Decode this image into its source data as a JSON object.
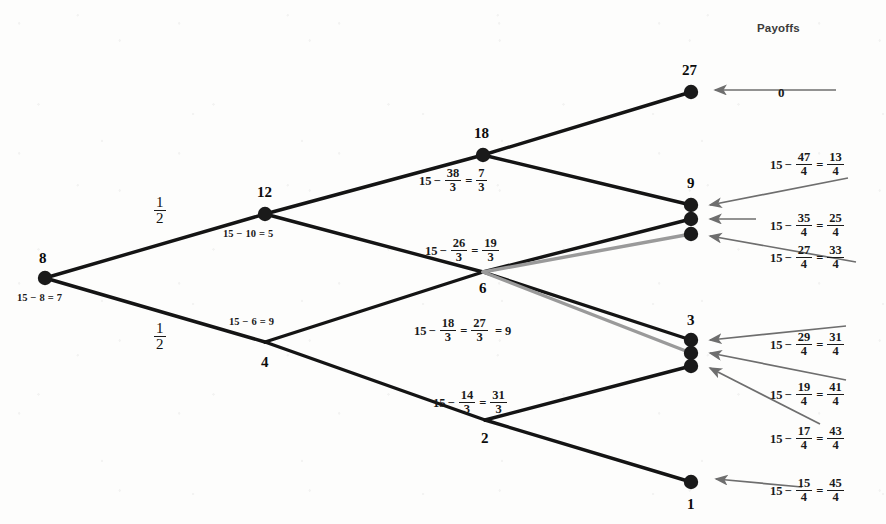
{
  "diagram": {
    "title": "Payoffs",
    "type": "game-tree",
    "nodes": [
      {
        "id": "n8",
        "label": "8",
        "x": 45,
        "y": 278,
        "dot": true,
        "label_dx": -6,
        "label_dy": -28
      },
      {
        "id": "n12",
        "label": "12",
        "x": 265,
        "y": 214,
        "dot": true,
        "label_dx": -8,
        "label_dy": -30
      },
      {
        "id": "n4",
        "label": "4",
        "x": 265,
        "y": 342,
        "dot": false,
        "label_dx": -4,
        "label_dy": 12
      },
      {
        "id": "n18",
        "label": "18",
        "x": 483,
        "y": 155,
        "dot": true,
        "label_dx": -9,
        "label_dy": -30
      },
      {
        "id": "n6",
        "label": "6",
        "x": 483,
        "y": 272,
        "dot": false,
        "label_dx": -4,
        "label_dy": 8
      },
      {
        "id": "n2",
        "label": "2",
        "x": 485,
        "y": 420,
        "dot": false,
        "label_dx": -4,
        "label_dy": 10
      },
      {
        "id": "n27",
        "label": "27",
        "x": 691,
        "y": 92,
        "dot": true,
        "label_dx": -9,
        "label_dy": -30
      },
      {
        "id": "n9",
        "label": "9",
        "x": 691,
        "y": 205,
        "dot": true,
        "label_dx": -4,
        "label_dy": -30
      },
      {
        "id": "n9b",
        "label": "",
        "x": 691,
        "y": 219,
        "dot": true,
        "label_dx": 0,
        "label_dy": 0
      },
      {
        "id": "n9c",
        "label": "",
        "x": 691,
        "y": 234,
        "dot": true,
        "label_dx": 0,
        "label_dy": 0
      },
      {
        "id": "n3",
        "label": "3",
        "x": 691,
        "y": 340,
        "dot": true,
        "label_dx": -4,
        "label_dy": -28
      },
      {
        "id": "n3b",
        "label": "",
        "x": 691,
        "y": 353,
        "dot": true,
        "label_dx": 0,
        "label_dy": 0
      },
      {
        "id": "n3c",
        "label": "",
        "x": 691,
        "y": 366,
        "dot": true,
        "label_dx": 0,
        "label_dy": 0
      },
      {
        "id": "n1",
        "label": "1",
        "x": 691,
        "y": 482,
        "dot": true,
        "label_dx": -4,
        "label_dy": 14
      }
    ],
    "edges": [
      {
        "from": "n8",
        "to": "n12",
        "color": "#141414",
        "width": 3.4
      },
      {
        "from": "n8",
        "to": "n4",
        "color": "#141414",
        "width": 3.4
      },
      {
        "from": "n12",
        "to": "n18",
        "color": "#141414",
        "width": 3.4
      },
      {
        "from": "n12",
        "to": "n6",
        "color": "#141414",
        "width": 3.4
      },
      {
        "from": "n4",
        "to": "n6",
        "color": "#141414",
        "width": 3.4
      },
      {
        "from": "n4",
        "to": "n2",
        "color": "#141414",
        "width": 3.4
      },
      {
        "from": "n18",
        "to": "n27",
        "color": "#141414",
        "width": 3.4
      },
      {
        "from": "n18",
        "to": "n9",
        "color": "#141414",
        "width": 3.4
      },
      {
        "from": "n6",
        "to": "n9b",
        "color": "#141414",
        "width": 3.4
      },
      {
        "from": "n6",
        "to": "n3",
        "color": "#141414",
        "width": 3.4
      },
      {
        "from": "n6",
        "to": "n9c",
        "color": "#9a9a9a",
        "width": 3.4
      },
      {
        "from": "n6",
        "to": "n3b",
        "color": "#9a9a9a",
        "width": 3.4
      },
      {
        "from": "n2",
        "to": "n3c",
        "color": "#141414",
        "width": 3.4
      },
      {
        "from": "n2",
        "to": "n1",
        "color": "#141414",
        "width": 3.4
      }
    ],
    "probability_labels": [
      {
        "id": "p-upper",
        "text": "1/2",
        "num": "1",
        "den": "2",
        "x": 152,
        "y": 196
      },
      {
        "id": "p-lower",
        "text": "1/2",
        "num": "1",
        "den": "2",
        "x": 152,
        "y": 322
      }
    ],
    "edge_equations": [
      {
        "id": "eq-n8",
        "x": 16,
        "y": 292,
        "parts": [
          {
            "t": "15"
          },
          {
            "t": "−"
          },
          {
            "t": "8"
          },
          {
            "t": "="
          },
          {
            "t": "7"
          }
        ]
      },
      {
        "id": "eq-n12",
        "x": 222,
        "y": 228,
        "parts": [
          {
            "t": "15"
          },
          {
            "t": "−"
          },
          {
            "t": "10"
          },
          {
            "t": "="
          },
          {
            "t": "5"
          }
        ]
      },
      {
        "id": "eq-n4",
        "x": 228,
        "y": 316,
        "parts": [
          {
            "t": "15"
          },
          {
            "t": "−"
          },
          {
            "t": "6"
          },
          {
            "t": "="
          },
          {
            "t": "9"
          }
        ]
      },
      {
        "id": "eq-n18",
        "x": 419,
        "y": 168,
        "frac": true
      },
      {
        "id": "eq-n6u",
        "x": 425,
        "y": 238,
        "frac": true
      },
      {
        "id": "eq-n6l",
        "x": 414,
        "y": 318,
        "frac": true
      },
      {
        "id": "eq-n2",
        "x": 433,
        "y": 390,
        "frac": true
      }
    ],
    "node_expressions": {
      "n18": {
        "a": "15",
        "minus": "−",
        "n1": "38",
        "d1": "3",
        "eq": "=",
        "n2": "7",
        "d2": "3",
        "tail": ""
      },
      "n6u": {
        "a": "15",
        "minus": "−",
        "n1": "26",
        "d1": "3",
        "eq": "=",
        "n2": "19",
        "d2": "3",
        "tail": ""
      },
      "n6l": {
        "a": "15",
        "minus": "−",
        "n1": "18",
        "d1": "3",
        "eq": "=",
        "n2": "27",
        "d2": "3",
        "tail": "= 9"
      },
      "n2": {
        "a": "15",
        "minus": "−",
        "n1": "14",
        "d1": "3",
        "eq": "=",
        "n2": "31",
        "d2": "3",
        "tail": ""
      }
    },
    "payoffs": [
      {
        "id": "payoff-27",
        "plain": "0",
        "x": 778,
        "y": 85,
        "target": "n27",
        "arrow": {
          "x1": 836,
          "y1": 90,
          "x2": 715,
          "y2": 90
        }
      },
      {
        "id": "payoff-9a",
        "a": "15",
        "minus": "−",
        "n1": "47",
        "d1": "4",
        "eq": "=",
        "n2": "13",
        "d2": "4",
        "x": 770,
        "y": 152,
        "target": "n9",
        "arrow": {
          "x1": 848,
          "y1": 178,
          "x2": 710,
          "y2": 205
        }
      },
      {
        "id": "payoff-9b",
        "a": "15",
        "minus": "−",
        "n1": "35",
        "d1": "4",
        "eq": "=",
        "n2": "25",
        "d2": "4",
        "x": 770,
        "y": 213,
        "target": "n9b",
        "arrow": {
          "x1": 756,
          "y1": 219,
          "x2": 710,
          "y2": 219
        }
      },
      {
        "id": "payoff-9c",
        "a": "15",
        "minus": "−",
        "n1": "27",
        "d1": "4",
        "eq": "=",
        "n2": "33",
        "d2": "4",
        "x": 770,
        "y": 245,
        "target": "n9c",
        "arrow": {
          "x1": 856,
          "y1": 262,
          "x2": 710,
          "y2": 236
        }
      },
      {
        "id": "payoff-3a",
        "a": "15",
        "minus": "−",
        "n1": "29",
        "d1": "4",
        "eq": "=",
        "n2": "31",
        "d2": "4",
        "x": 770,
        "y": 332,
        "target": "n3",
        "arrow": {
          "x1": 846,
          "y1": 326,
          "x2": 710,
          "y2": 340
        }
      },
      {
        "id": "payoff-3b",
        "a": "15",
        "minus": "−",
        "n1": "19",
        "d1": "4",
        "eq": "=",
        "n2": "41",
        "d2": "4",
        "x": 770,
        "y": 382,
        "target": "n3b",
        "arrow": {
          "x1": 846,
          "y1": 380,
          "x2": 710,
          "y2": 353
        }
      },
      {
        "id": "payoff-3c",
        "a": "15",
        "minus": "−",
        "n1": "17",
        "d1": "4",
        "eq": "=",
        "n2": "43",
        "d2": "4",
        "x": 770,
        "y": 426,
        "target": "n3c",
        "arrow": {
          "x1": 820,
          "y1": 424,
          "x2": 710,
          "y2": 368
        }
      },
      {
        "id": "payoff-1",
        "a": "15",
        "minus": "−",
        "n1": "15",
        "d1": "4",
        "eq": "=",
        "n2": "45",
        "d2": "4",
        "x": 770,
        "y": 478,
        "target": "n1",
        "arrow": {
          "x1": 802,
          "y1": 487,
          "x2": 716,
          "y2": 479
        }
      }
    ],
    "colors": {
      "edge_black": "#141414",
      "edge_gray": "#9a9a9a",
      "arrow_gray": "#6e6e6e",
      "node_fill": "#1a1a1a",
      "text": "#111111",
      "title_text": "#3b3b3b",
      "background": "#fdfdfc"
    },
    "title_position": {
      "x": 757,
      "y": 22
    }
  }
}
